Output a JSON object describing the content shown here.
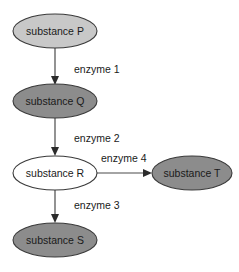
{
  "diagram": {
    "type": "flow-diagram",
    "background_color": "#ffffff",
    "colors": {
      "fill_light_gray": "#c8c8c8",
      "fill_dark_gray": "#8c8c8c",
      "fill_white": "#ffffff",
      "node_outline": "#3a3a3a",
      "arrow": "#4a4a4a",
      "text": "#1a1a1a"
    },
    "nodes": [
      {
        "id": "P",
        "label": "substance P",
        "fill": "#c8c8c8",
        "shade": "light-gray",
        "cx": 55,
        "cy": 31,
        "rx": 42,
        "ry": 17
      },
      {
        "id": "Q",
        "label": "substance Q",
        "fill": "#8c8c8c",
        "shade": "dark-gray",
        "cx": 55,
        "cy": 101,
        "rx": 42,
        "ry": 17
      },
      {
        "id": "R",
        "label": "substance R",
        "fill": "#ffffff",
        "shade": "white",
        "cx": 55,
        "cy": 173,
        "rx": 42,
        "ry": 17
      },
      {
        "id": "S",
        "label": "substance S",
        "fill": "#8c8c8c",
        "shade": "dark-gray",
        "cx": 55,
        "cy": 240,
        "rx": 42,
        "ry": 17
      },
      {
        "id": "T",
        "label": "substance T",
        "fill": "#8c8c8c",
        "shade": "dark-gray",
        "cx": 192,
        "cy": 173,
        "rx": 40,
        "ry": 17
      }
    ],
    "edges": [
      {
        "id": "e1",
        "label": "enzyme 1",
        "from": "P",
        "to": "Q",
        "direction": "down",
        "label_x": 74,
        "label_y": 70
      },
      {
        "id": "e2",
        "label": "enzyme 2",
        "from": "Q",
        "to": "R",
        "direction": "down",
        "label_x": 74,
        "label_y": 139
      },
      {
        "id": "e3",
        "label": "enzyme 3",
        "from": "R",
        "to": "S",
        "direction": "down",
        "label_x": 74,
        "label_y": 206
      },
      {
        "id": "e4",
        "label": "enzyme 4",
        "from": "R",
        "to": "T",
        "direction": "right",
        "label_x": 101,
        "label_y": 159
      }
    ]
  }
}
